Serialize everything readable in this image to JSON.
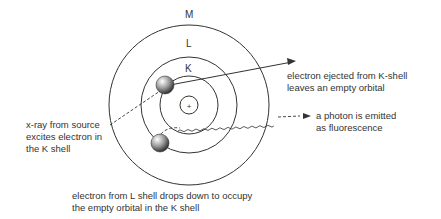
{
  "diagram": {
    "shells": [
      {
        "name": "K",
        "radius": 29
      },
      {
        "name": "L",
        "radius": 48
      },
      {
        "name": "M",
        "radius": 80
      }
    ],
    "nucleus_symbol": "+",
    "annotations": {
      "ejected": [
        "electron ejected from K-shell",
        "leaves an empty orbital"
      ],
      "photon": [
        "a photon is emitted",
        "as fluorescence"
      ],
      "xray": [
        "x-ray from source",
        "excites electron in",
        "the K shell"
      ],
      "drop": [
        "electron from L shell drops down to occupy",
        "the empty orbital in the K shell"
      ]
    },
    "colors": {
      "line": "#333333",
      "text": "#333333",
      "electron": "#777777"
    }
  }
}
